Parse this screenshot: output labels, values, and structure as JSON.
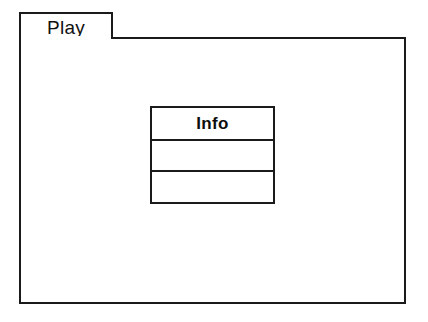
{
  "diagram": {
    "kind": "uml-package-diagram",
    "background_color": "#ffffff",
    "line_color": "#1a1a1a"
  },
  "package": {
    "tab_label": "Play",
    "body_text": ""
  },
  "class_box": {
    "name": "Info",
    "attributes_text": "",
    "operations_text": ""
  }
}
